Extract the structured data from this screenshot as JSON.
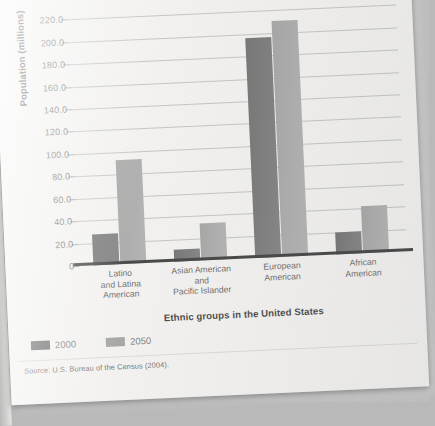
{
  "page": {
    "source_note": "Source: U.S. Bureau of the Census (2004)."
  },
  "legend": {
    "items": [
      {
        "label": "2000",
        "color": "#3f3f3f"
      },
      {
        "label": "2050",
        "color": "#8e8e8e"
      }
    ]
  },
  "chart_data": {
    "type": "bar",
    "title": "",
    "xlabel": "Ethnic groups in the United States",
    "ylabel": "Population (millions)",
    "categories": [
      "Latino and Latina American",
      "Asian American and Pacific Islander",
      "European American",
      "African American"
    ],
    "category_lines": [
      [
        "Latino",
        "and Latina",
        "American"
      ],
      [
        "Asian American",
        "and",
        "Pacific Islander"
      ],
      [
        "European",
        "American"
      ],
      [
        "African",
        "American"
      ]
    ],
    "series": [
      {
        "name": "2000",
        "color": "#3f3f3f",
        "values": [
          28,
          11,
          196,
          20
        ]
      },
      {
        "name": "2050",
        "color": "#8e8e8e",
        "values": [
          93,
          33,
          210,
          42
        ]
      }
    ],
    "ylim": [
      0,
      230
    ],
    "yticks": [
      0,
      20,
      40,
      60,
      80,
      100,
      120,
      140,
      160,
      180,
      200,
      220
    ],
    "ytick_labels": [
      "0",
      "20.0",
      "40.0",
      "60.0",
      "80.0",
      "100.0",
      "120.0",
      "140.0",
      "160.0",
      "180.0",
      "200.0",
      "220.0"
    ],
    "grid": true,
    "legend_position": "bottom-left"
  }
}
